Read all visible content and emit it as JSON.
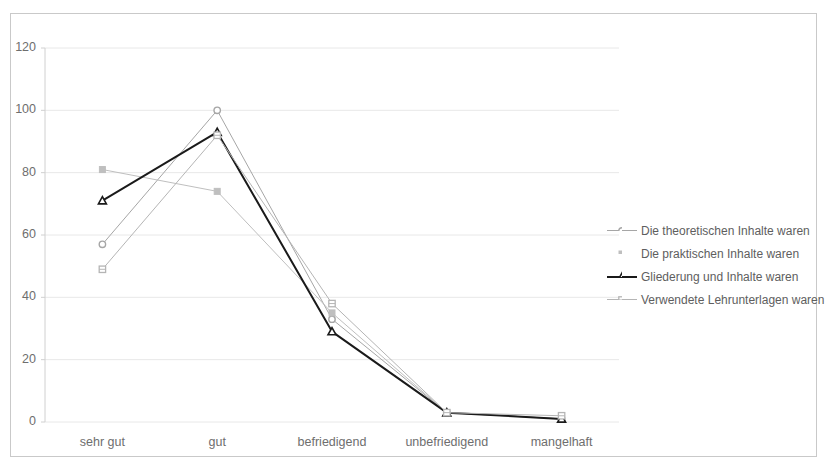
{
  "chart_data": {
    "type": "line",
    "title": "",
    "xlabel": "",
    "ylabel": "",
    "categories": [
      "sehr gut",
      "gut",
      "befriedigend",
      "unbefriedigend",
      "mangelhaft"
    ],
    "yticks": [
      0,
      20,
      40,
      60,
      80,
      100,
      120
    ],
    "ylim": [
      0,
      120
    ],
    "grid": true,
    "legend_position": "right",
    "series": [
      {
        "name": "Die theoretischen Inhalte waren",
        "values": [
          57,
          100,
          33,
          3,
          1
        ],
        "color": "#a6a6a6",
        "marker": "circle",
        "line_width": 1
      },
      {
        "name": "Die praktischen Inhalte waren",
        "values": [
          81,
          74,
          35,
          3,
          1
        ],
        "color": "#bfbfbf",
        "marker": "square",
        "line_width": 1
      },
      {
        "name": "Gliederung und Inhalte waren",
        "values": [
          71,
          93,
          29,
          3,
          1
        ],
        "color": "#1a1a1a",
        "marker": "triangle",
        "line_width": 2
      },
      {
        "name": "Verwendete Lehrunterlagen waren",
        "values": [
          49,
          92,
          38,
          3,
          2
        ],
        "color": "#b5b5b5",
        "marker": "square-outline",
        "line_width": 1
      }
    ]
  },
  "axes": {
    "ytick_labels": [
      "120",
      "100",
      "80",
      "60",
      "40",
      "20",
      "0"
    ],
    "xtick_labels": [
      "sehr gut",
      "gut",
      "befriedigend",
      "unbefriedigend",
      "mangelhaft"
    ]
  },
  "legend": {
    "items": [
      {
        "label": "Die theoretischen Inhalte waren"
      },
      {
        "label": "Die praktischen Inhalte waren"
      },
      {
        "label": "Gliederung und Inhalte waren"
      },
      {
        "label": "Verwendete Lehrunterlagen waren"
      }
    ]
  },
  "colors": {
    "frame_border": "#c9c9c9",
    "gridline": "#e8e8e8",
    "axis_line": "#d0d0d0",
    "tick_text": "#6e6e6e",
    "legend_text": "#5e5e5e",
    "background": "#ffffff"
  }
}
